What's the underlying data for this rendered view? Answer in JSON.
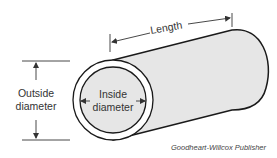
{
  "diagram": {
    "labels": {
      "length": "Length",
      "outside_diameter_line1": "Outside",
      "outside_diameter_line2": "diameter",
      "inside_diameter_line1": "Inside",
      "inside_diameter_line2": "diameter"
    },
    "credit": "Goodheart-Willcox Publisher",
    "colors": {
      "tube_fill": "#e6e6e6",
      "outline": "#1a1a1a",
      "dimension_line": "#333333",
      "wall_fill": "#ffffff"
    }
  }
}
